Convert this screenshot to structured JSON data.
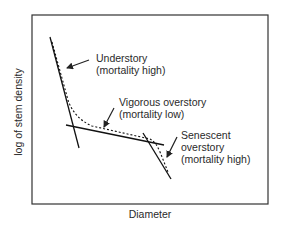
{
  "axes": {
    "xlabel": "Diameter",
    "ylabel": "log of stem density"
  },
  "annotations": [
    {
      "id": "understory",
      "line1": "Understory",
      "line2": "(mortality high)"
    },
    {
      "id": "vigorous",
      "line1": "Vigorous overstory",
      "line2": "(mortality low)"
    },
    {
      "id": "senescent",
      "line1": "Senescent",
      "line2": "overstory",
      "line3": "(mortality high)"
    }
  ],
  "legend": {
    "solid_lines": "fitted mortality phases",
    "dashed_line": "observed curve"
  }
}
